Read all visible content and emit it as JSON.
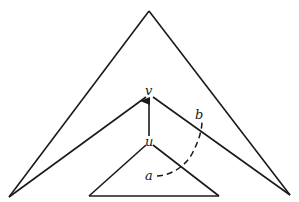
{
  "diagram": {
    "type": "tree-path-illustration",
    "colors": {
      "stroke": "#1a1a1a",
      "background": "#ffffff"
    },
    "labels": {
      "v": "v",
      "u": "u",
      "a": "a",
      "b": "b"
    },
    "shapes": {
      "outer_triangle": {
        "apex": [
          149,
          11
        ],
        "left": [
          9,
          197
        ],
        "right": [
          290,
          195
        ],
        "inner_vertex": [
          149,
          97
        ]
      },
      "inner_triangle": {
        "apex": [
          149,
          145
        ],
        "left": [
          89,
          196
        ],
        "right": [
          219,
          196
        ]
      },
      "arrow": {
        "from": [
          149,
          136
        ],
        "to": [
          149,
          99
        ],
        "description": "edge from u to v"
      },
      "dashed_path": {
        "from_label": "a",
        "to_label": "b",
        "description": "dashed curve from a to b crossing subtree boundaries"
      }
    }
  }
}
